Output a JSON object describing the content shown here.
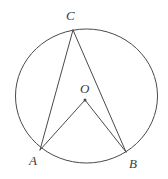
{
  "figure": {
    "kind": "geometry-diagram",
    "background_color": "#ffffff",
    "stroke_color": "#4a4a4a",
    "label_color": "#3b3b3b",
    "stroke_width": 1,
    "canvas": {
      "width": 168,
      "height": 179
    },
    "circle": {
      "name": "circumscribed-circle",
      "center_x": 86.5,
      "center_y": 96,
      "radius_x": 71,
      "radius_y": 67
    },
    "points": [
      {
        "id": "C",
        "label": "C",
        "x": 73,
        "y": 30,
        "dot": false
      },
      {
        "id": "O",
        "label": "O",
        "x": 85,
        "y": 100,
        "dot": true
      },
      {
        "id": "A",
        "label": "A",
        "x": 40,
        "y": 150,
        "dot": false
      },
      {
        "id": "B",
        "label": "B",
        "x": 126,
        "y": 152,
        "dot": false
      }
    ],
    "segments": [
      {
        "id": "CA",
        "from": "C",
        "to": "A",
        "x1": 73,
        "y1": 30,
        "x2": 40,
        "y2": 150
      },
      {
        "id": "CB",
        "from": "C",
        "to": "B",
        "x1": 73,
        "y1": 30,
        "x2": 126,
        "y2": 152
      },
      {
        "id": "OA",
        "from": "O",
        "to": "A",
        "x1": 85,
        "y1": 100,
        "x2": 40,
        "y2": 150
      },
      {
        "id": "OB",
        "from": "O",
        "to": "B",
        "x1": 85,
        "y1": 100,
        "x2": 126,
        "y2": 152
      }
    ],
    "labels": {
      "C": "C",
      "O": "O",
      "A": "A",
      "B": "B"
    }
  }
}
